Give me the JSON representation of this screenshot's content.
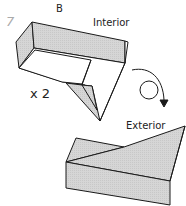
{
  "diagram": {
    "step_number": "7",
    "labels": {
      "top_flap": "B",
      "top_view": "Interior",
      "bottom_view": "Exterior",
      "repeat": "x 2"
    },
    "arrow": "turn-over-arrow",
    "colors": {
      "fill_gray": "#d4d4d4",
      "stroke": "#1a1a1a",
      "background": "#ffffff"
    }
  }
}
